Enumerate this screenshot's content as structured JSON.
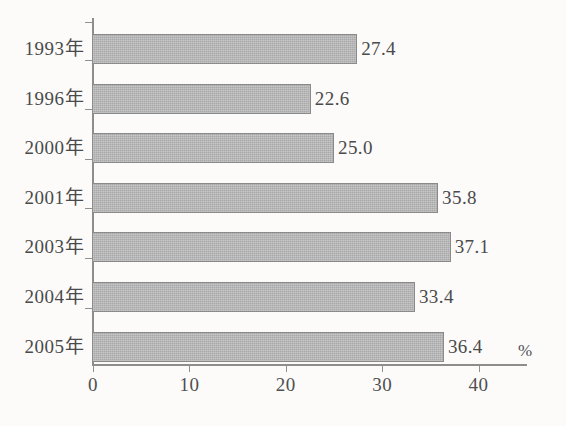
{
  "chart_data": {
    "type": "bar",
    "orientation": "horizontal",
    "title": "",
    "subtitle": "",
    "xlabel": "",
    "ylabel": "",
    "unit_label": "%",
    "categories": [
      "1993年",
      "1996年",
      "2000年",
      "2001年",
      "2003年",
      "2004年",
      "2005年"
    ],
    "values": [
      27.4,
      22.6,
      25.0,
      35.8,
      37.1,
      33.4,
      36.4
    ],
    "value_labels": [
      "27.4",
      "22.6",
      "25.0",
      "35.8",
      "37.1",
      "33.4",
      "36.4"
    ],
    "xlim": [
      0,
      45
    ],
    "xticks": [
      0,
      10,
      20,
      30,
      40
    ],
    "xtick_labels": [
      "0",
      "10",
      "20",
      "30",
      "40"
    ],
    "grid": false,
    "legend": null,
    "legend_position": "none",
    "colors": {
      "bar_fill": "#a9a9a9",
      "bar_border": "#8a8a8a",
      "axis": "#8d8d8d",
      "text": "#4a4a4a",
      "background": "#fcfbfa"
    }
  }
}
